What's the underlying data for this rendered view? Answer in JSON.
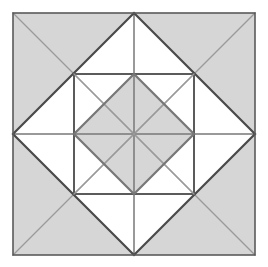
{
  "figure": {
    "canvas": {
      "width": 268,
      "height": 267,
      "background": "#ffffff"
    },
    "palette": {
      "fill_gray": "#d6d6d6",
      "fill_white": "#ffffff",
      "stroke_dark": "#4a4a4a",
      "stroke_mid": "#777777",
      "stroke_light": "#9a9a9a",
      "outer_border": "#5a5a5a"
    },
    "geometry": {
      "outer_square": {
        "x0": 13,
        "y0": 13,
        "x1": 255,
        "y1": 255,
        "side": 242
      },
      "center": {
        "x": 134,
        "y": 134
      },
      "outer_diamond_vertices": [
        {
          "x": 134,
          "y": 13
        },
        {
          "x": 255,
          "y": 134
        },
        {
          "x": 134,
          "y": 255
        },
        {
          "x": 13,
          "y": 134
        }
      ],
      "inner_square": {
        "x0": 74,
        "y0": 74,
        "x1": 194,
        "y1": 194,
        "side": 120
      },
      "inner_diamond_vertices": [
        {
          "x": 134,
          "y": 74
        },
        {
          "x": 194,
          "y": 134
        },
        {
          "x": 134,
          "y": 194
        },
        {
          "x": 74,
          "y": 134
        }
      ],
      "midpoints": {
        "top": {
          "x": 134,
          "y": 13
        },
        "right": {
          "x": 255,
          "y": 134
        },
        "bottom": {
          "x": 134,
          "y": 255
        },
        "left": {
          "x": 13,
          "y": 134
        }
      }
    },
    "regions": {
      "outer_corner_triangles": 4,
      "outer_white_triangles": 4,
      "inner_gray_diamond_quadrants": 4,
      "inner_white_corner_triangles": 4
    },
    "line_weights": {
      "outer_border": 1.6,
      "outer_diamond": 2.2,
      "outer_corner_diagonal": 1.3,
      "inner_square": 1.8,
      "inner_diamond": 2.2,
      "inner_cross": 1.5,
      "inner_diagonal": 1.3
    },
    "labels": {
      "figure_name": "Nested Squares Diamond Pattern",
      "description": "A square containing an inscribed diamond, a nested inner square with its own inscribed diamond, all subdivided by diagonals and a central cross."
    }
  }
}
